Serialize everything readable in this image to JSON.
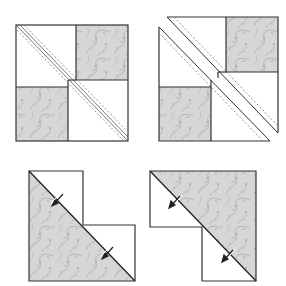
{
  "diagram": {
    "colors": {
      "background": "#ffffff",
      "outline": "#333333",
      "fabric_base": "#d6d6d6",
      "fabric_swirl": "#b4b4b4",
      "fabric_highlight": "#e6e6e6",
      "stitch_line": "#777777",
      "arrow": "#222222"
    },
    "figures": [
      {
        "id": "step-1-sewn-block",
        "label": "Block with two stitch lines along diagonal"
      },
      {
        "id": "step-2-cut-block",
        "label": "Block cut apart between stitch lines"
      },
      {
        "id": "step-3-pressed-unit-a",
        "label": "Pressed unit, print in lower-left triangle"
      },
      {
        "id": "step-4-pressed-unit-b",
        "label": "Pressed unit, print in upper-right triangle"
      }
    ]
  }
}
